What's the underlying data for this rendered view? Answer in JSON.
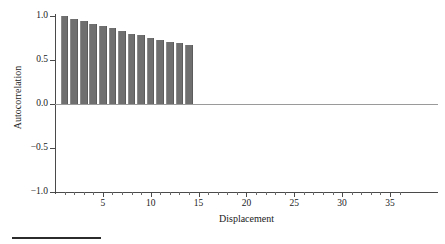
{
  "chart_data": {
    "type": "bar",
    "title": "",
    "subtitle": "",
    "xlabel": "Displacement",
    "ylabel": "Autocorrelation",
    "xlim": [
      0,
      36.5
    ],
    "ylim": [
      -1.0,
      1.0
    ],
    "grid": false,
    "legend": null,
    "bar_color": "#6f6f6f",
    "axis_color": "#4a4a4a",
    "baseline_color": "#9a9a9a",
    "baseline_value": 0.0,
    "categories": [
      1,
      2,
      3,
      4,
      5,
      6,
      7,
      8,
      9,
      10,
      11,
      12,
      13,
      14
    ],
    "values": [
      1.0,
      0.97,
      0.94,
      0.91,
      0.89,
      0.86,
      0.83,
      0.8,
      0.78,
      0.75,
      0.73,
      0.71,
      0.69,
      0.67
    ],
    "x_ticks_major": [
      5,
      10,
      15,
      20,
      25,
      30,
      35
    ],
    "x_tick_labels": [
      "5",
      "10",
      "15",
      "20",
      "25",
      "30",
      "35"
    ],
    "x_ticks_minor": [
      1,
      2,
      3,
      4,
      6,
      7,
      8,
      9,
      11,
      12,
      13,
      14,
      16,
      17,
      18,
      19,
      21,
      22,
      23,
      24,
      26,
      27,
      28,
      29,
      31,
      32,
      33,
      34,
      36
    ],
    "y_ticks": [
      1.0,
      0.5,
      0.0,
      -0.5,
      -1.0
    ],
    "y_tick_labels": [
      "1.0",
      "0.5",
      "0.0",
      "-0.5",
      "-1.0"
    ]
  },
  "figure": {
    "bottom_rule_present": true
  }
}
